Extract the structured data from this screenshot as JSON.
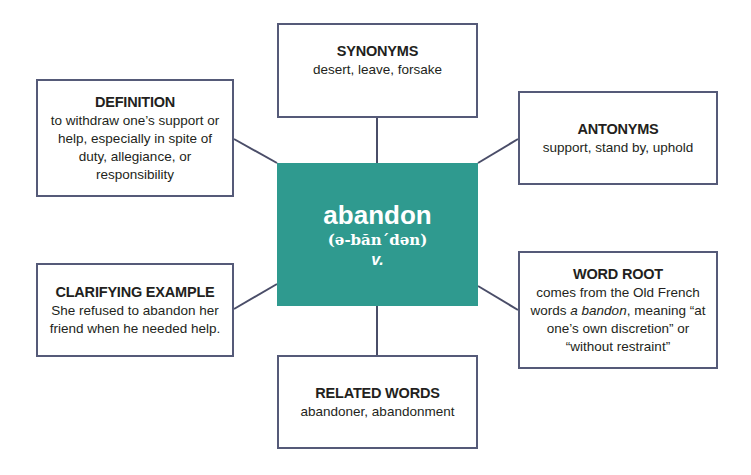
{
  "diagram": {
    "type": "word-map",
    "center": {
      "word": "abandon",
      "pronunciation": "(ə-băn´dən)",
      "part_of_speech": "v.",
      "color": "#2f9a8f"
    },
    "nodes": {
      "synonyms": {
        "title": "SYNONYMS",
        "body": "desert, leave, forsake"
      },
      "definition": {
        "title": "DEFINITION",
        "body": "to withdraw one’s support or help, especially in spite of duty, allegiance, or responsibility"
      },
      "antonyms": {
        "title": "ANTONYMS",
        "body": "support, stand by, uphold"
      },
      "example": {
        "title": "CLARIFYING EXAMPLE",
        "body": "She refused to abandon her friend when he needed help."
      },
      "word_root": {
        "title": "WORD ROOT",
        "body_pre": "comes from the Old French words ",
        "body_italic": "a bandon",
        "body_post": ", meaning “at one’s own discretion” or “without restraint”"
      },
      "related": {
        "title": "RELATED WORDS",
        "body": "abandoner, abandonment"
      }
    },
    "edges": [
      {
        "from": "center",
        "to": "synonyms"
      },
      {
        "from": "center",
        "to": "definition"
      },
      {
        "from": "center",
        "to": "antonyms"
      },
      {
        "from": "center",
        "to": "example"
      },
      {
        "from": "center",
        "to": "word_root"
      },
      {
        "from": "center",
        "to": "related"
      }
    ]
  }
}
